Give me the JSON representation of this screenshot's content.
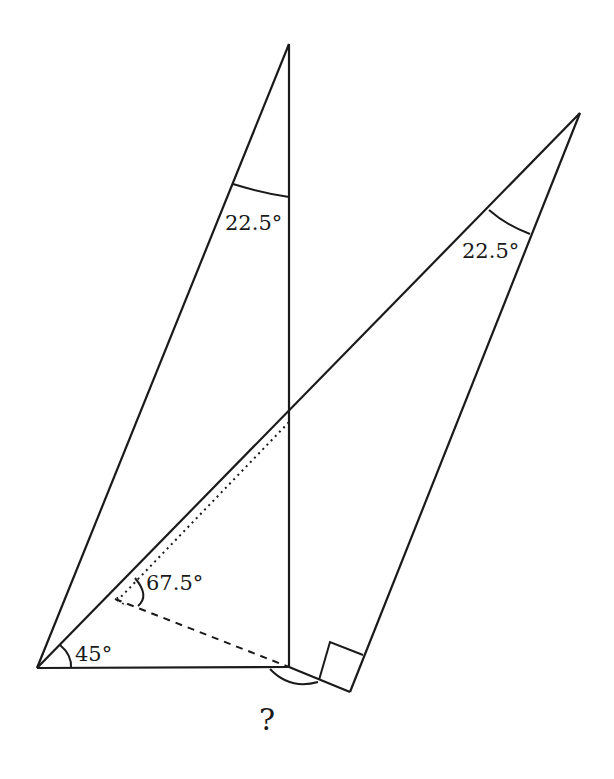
{
  "diagram": {
    "type": "geometry",
    "labels": {
      "top_angle": "22.5°",
      "right_angle_label": "22.5°",
      "mid_angle": "67.5°",
      "base_angle": "45°",
      "unknown": "?"
    },
    "points": {
      "A_bottom_left": [
        37,
        668
      ],
      "B_top": [
        289,
        44
      ],
      "C_foot": [
        289,
        667
      ],
      "D_intersection": [
        289,
        418
      ],
      "E_right_top": [
        580,
        113
      ],
      "F_right_corner": [
        350,
        692
      ],
      "G_dash_start": [
        115,
        599
      ]
    },
    "colors": {
      "stroke": "#1a1a1a",
      "background": "#ffffff"
    }
  }
}
